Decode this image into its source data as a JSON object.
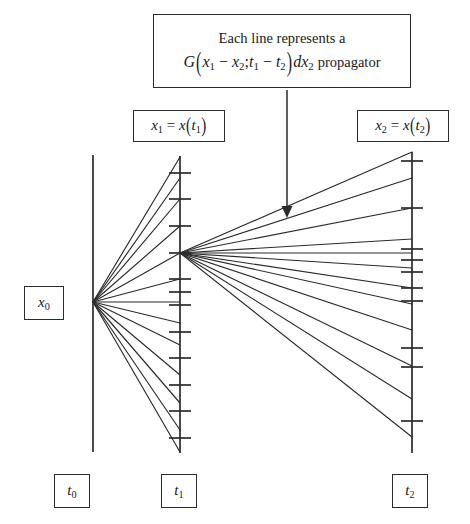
{
  "figure": {
    "background_color": "#ffffff",
    "line_color": "#2b2b2b"
  },
  "annotation": {
    "name": "propagator-annotation",
    "line1": "Each line represents  a",
    "formula_plain": "G(x1 - x2; t1 - t2)dx2",
    "formula_parts": {
      "G": "G",
      "open": "(",
      "x1": "x",
      "x1sub": "1",
      "minus1": "−",
      "x2": "x",
      "x2sub": "2",
      "semicolon": ";",
      "t1": "t",
      "t1sub": "1",
      "minus2": "−",
      "t2": "t",
      "t2sub": "2",
      "close": ")",
      "dx": "dx",
      "dxsub": "2"
    },
    "trailing_word": "propagator",
    "arrow": {
      "name": "annotation-arrow",
      "x": 287,
      "y_start": 90,
      "y_end": 218,
      "direction": "down"
    }
  },
  "axis_labels": {
    "x1": {
      "lhs_var": "x",
      "lhs_sub": "1",
      "equals": "=",
      "rhs_fn": "x",
      "rhs_open": "(",
      "rhs_var": "t",
      "rhs_sub": "1",
      "rhs_close": ")",
      "plain": "x1 = x(t1)"
    },
    "x2": {
      "lhs_var": "x",
      "lhs_sub": "2",
      "equals": "=",
      "rhs_fn": "x",
      "rhs_open": "(",
      "rhs_var": "t",
      "rhs_sub": "2",
      "rhs_close": ")",
      "plain": "x2 = x(t2)"
    },
    "x0": {
      "var": "x",
      "sub": "0",
      "plain": "x0"
    }
  },
  "time_labels": [
    {
      "name": "t0",
      "var": "t",
      "sub": "0",
      "plain": "t0"
    },
    {
      "name": "t1",
      "var": "t",
      "sub": "1",
      "plain": "t1"
    },
    {
      "name": "t2",
      "var": "t",
      "sub": "2",
      "plain": "t2"
    }
  ],
  "chart_data": {
    "type": "diagram",
    "axes": [
      {
        "name": "t0-axis",
        "x": 93,
        "y_top": 155,
        "y_bottom": 452,
        "ticks": []
      },
      {
        "name": "t1-axis",
        "x": 180,
        "y_top": 156,
        "y_bottom": 453,
        "ticks": [
          173,
          199,
          226,
          253,
          279,
          292,
          305,
          332,
          358,
          385,
          411,
          438
        ]
      },
      {
        "name": "t2-axis",
        "x": 412,
        "y_top": 152,
        "y_bottom": 453,
        "ticks": [
          161,
          208,
          249,
          260,
          272,
          288,
          301,
          348,
          367,
          421
        ]
      }
    ],
    "fan_left": {
      "name": "fan-t0-to-t1",
      "origin": [
        93,
        302
      ],
      "target_x": 180,
      "target_ys": [
        157,
        178,
        199,
        226,
        253,
        279,
        302,
        323,
        345,
        375,
        403,
        430,
        452
      ]
    },
    "fan_right": {
      "name": "fan-t1-to-t2",
      "origin": [
        180,
        253
      ],
      "target_x": 412,
      "target_ys": [
        152,
        178,
        208,
        239,
        253,
        268,
        288,
        304,
        330,
        366,
        399,
        437
      ]
    }
  }
}
